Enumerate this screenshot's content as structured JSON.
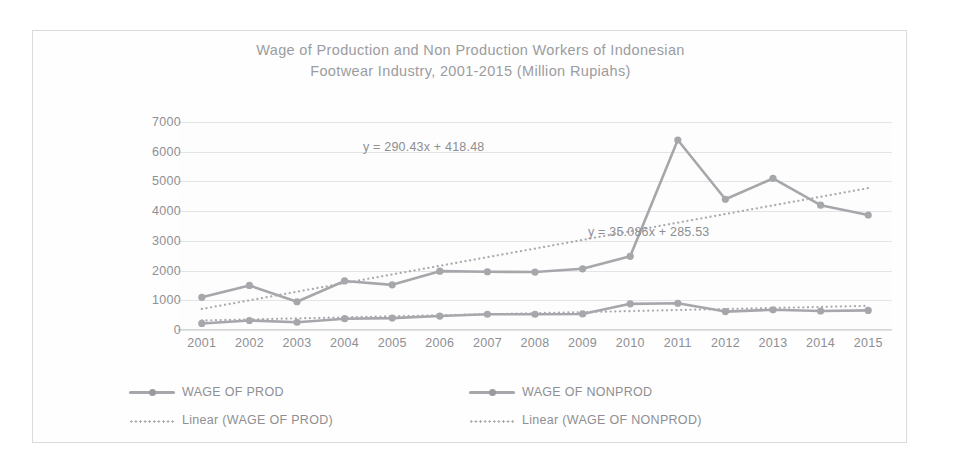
{
  "chart_data": {
    "type": "line",
    "title": "Wage of Production and Non Production Workers of Indonesian\nFootwear Industry, 2001-2015 (Million Rupiahs)",
    "title_line1": "Wage of Production and Non Production Workers of Indonesian",
    "title_line2": "Footwear Industry, 2001-2015 (Million Rupiahs)",
    "xlabel": "",
    "ylabel": "",
    "ylim": [
      0,
      7000
    ],
    "ytick_step": 1000,
    "yticks": [
      "7000",
      "6000",
      "5000",
      "4000",
      "3000",
      "2000",
      "1000",
      "0"
    ],
    "ytick_values": [
      7000,
      6000,
      5000,
      4000,
      3000,
      2000,
      1000,
      0
    ],
    "categories": [
      "2001",
      "2002",
      "2003",
      "2004",
      "2005",
      "2006",
      "2007",
      "2008",
      "2009",
      "2010",
      "2011",
      "2012",
      "2013",
      "2014",
      "2015"
    ],
    "grid": true,
    "legend_position": "bottom",
    "series": [
      {
        "name": "WAGE OF PROD",
        "style": "solid-marker",
        "color": "#a6a7ab",
        "values": [
          1100,
          1500,
          950,
          1650,
          1520,
          1980,
          1960,
          1950,
          2060,
          2480,
          6395,
          4400,
          5100,
          4200,
          3870
        ]
      },
      {
        "name": "WAGE OF NONPROD",
        "style": "solid-marker",
        "color": "#a6a7ab",
        "values": [
          220,
          320,
          260,
          380,
          400,
          470,
          530,
          530,
          540,
          880,
          900,
          620,
          680,
          640,
          660
        ]
      },
      {
        "name": "Linear (WAGE OF PROD)",
        "style": "dotted",
        "color": "#a9aaae",
        "equation": "y = 290.43x + 418.48",
        "slope": 290.43,
        "intercept": 418.48
      },
      {
        "name": "Linear (WAGE OF NONPROD)",
        "style": "dotted",
        "color": "#a9aaae",
        "equation": "y = 35.086x + 285.53",
        "slope": 35.086,
        "intercept": 285.53
      }
    ],
    "annotations": [
      {
        "text": "y = 290.43x + 418.48",
        "series": "Linear (WAGE OF PROD)"
      },
      {
        "text": "y = 35.086x + 285.53",
        "series": "Linear (WAGE OF NONPROD)"
      }
    ],
    "legend": [
      {
        "label": "WAGE OF PROD",
        "marker": "solid-line-marker"
      },
      {
        "label": "WAGE OF NONPROD",
        "marker": "solid-line-marker"
      },
      {
        "label": "Linear (WAGE OF PROD)",
        "marker": "dotted-line"
      },
      {
        "label": "Linear (WAGE OF NONPROD)",
        "marker": "dotted-line"
      }
    ]
  },
  "colors": {
    "series_gray": "#a6a7ab",
    "text_gray": "#8e8f93",
    "title_gray": "#9b9ca0",
    "gridline": "#e3e4e6",
    "frame": "#d9dadc",
    "background": "#ffffff"
  }
}
